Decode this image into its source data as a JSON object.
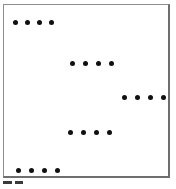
{
  "figure": {
    "background_color": "#ffffff",
    "border_color": "#8d8d8d",
    "border_shadow_color": "#6e6e6e",
    "dot_color": "#101010",
    "panel": {
      "x": 3,
      "y": 4,
      "width": 167,
      "height": 174
    },
    "dot_count_total": 20,
    "group_count": 5,
    "dots_per_group": 4
  },
  "chart_data": {
    "type": "scatter",
    "title": "",
    "subtitle": "",
    "xlabel": "",
    "ylabel": "",
    "grid": false,
    "legend": "none",
    "axis_ticks": "none",
    "marker": "filled-circle",
    "marker_color": "#101010",
    "marker_size_px": 5,
    "xlim": [
      0,
      167
    ],
    "ylim": [
      0,
      174
    ],
    "series": [
      {
        "name": "group-1",
        "row_index": 1,
        "y": 15,
        "x": [
          9,
          21,
          33,
          45
        ],
        "values": [
          15,
          15,
          15,
          15
        ]
      },
      {
        "name": "group-2",
        "row_index": 2,
        "y": 56,
        "x": [
          66,
          79,
          92,
          105
        ],
        "values": [
          56,
          56,
          56,
          56
        ]
      },
      {
        "name": "group-3",
        "row_index": 3,
        "y": 90,
        "x": [
          118,
          131,
          144,
          157
        ],
        "values": [
          90,
          90,
          90,
          90
        ]
      },
      {
        "name": "group-4",
        "row_index": 4,
        "y": 125,
        "x": [
          64,
          77,
          90,
          103
        ],
        "values": [
          125,
          125,
          125,
          125
        ]
      },
      {
        "name": "group-5",
        "row_index": 5,
        "y": 163,
        "x": [
          12,
          25,
          38,
          51
        ],
        "values": [
          163,
          163,
          163,
          163
        ]
      }
    ]
  },
  "caption": {
    "fragments": [
      {
        "name": "caption-mark-left",
        "x": 0,
        "width": 9
      },
      {
        "name": "caption-mark-right",
        "x": 12,
        "width": 8
      }
    ]
  }
}
